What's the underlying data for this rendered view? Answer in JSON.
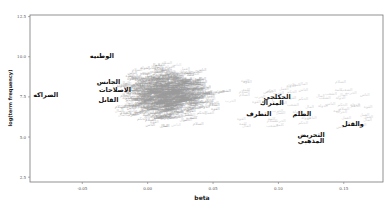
{
  "chart_data": {
    "type": "scatter",
    "title": "",
    "xlabel": "beta",
    "ylabel": "log(term frequency)",
    "xlim": [
      -0.09,
      0.18
    ],
    "ylim": [
      2.2,
      12.6
    ],
    "x_ticks": [
      "-0.05",
      "0.00",
      "0.05",
      "0.10",
      "0.15"
    ],
    "x_tick_values": [
      -0.05,
      0.0,
      0.05,
      0.1,
      0.15
    ],
    "y_ticks": [
      "12.5",
      "10.0",
      "7.5",
      "5.0",
      "2.5"
    ],
    "y_tick_values": [
      12.5,
      10.0,
      7.5,
      5.0,
      2.5
    ],
    "grid": false,
    "legend": null,
    "annotations": [
      {
        "text": "الوطنيه",
        "x": -0.035,
        "y": 9.9
      },
      {
        "text": "الجانس",
        "x": -0.03,
        "y": 8.3
      },
      {
        "text": "الاصلاحات",
        "x": -0.025,
        "y": 7.8
      },
      {
        "text": "الضراكه",
        "x": -0.078,
        "y": 7.5
      },
      {
        "text": "القانل",
        "x": -0.03,
        "y": 7.2
      },
      {
        "text": "الحكلجي",
        "x": 0.099,
        "y": 7.4
      },
      {
        "text": "المتراك",
        "x": 0.095,
        "y": 7.0
      },
      {
        "text": "التطرف",
        "x": 0.085,
        "y": 6.3
      },
      {
        "text": "الظلم",
        "x": 0.118,
        "y": 6.3
      },
      {
        "text": "والقتل",
        "x": 0.157,
        "y": 5.7
      },
      {
        "text": "التحريض",
        "x": 0.125,
        "y": 5.0
      },
      {
        "text": "المذهبي",
        "x": 0.125,
        "y": 4.6
      }
    ]
  }
}
